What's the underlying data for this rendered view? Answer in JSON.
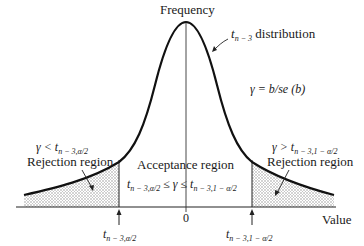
{
  "diagram": {
    "type": "t-distribution hypothesis test regions",
    "y_axis_label": "Frequency",
    "x_axis_label": "Value",
    "center_tick_label": "0",
    "curve_label": {
      "prefix": "t",
      "subscript": "n − 3",
      "suffix": " distribution"
    },
    "statistic": "γ = b/se (b)",
    "left_region": {
      "condition_prefix": "γ < t",
      "condition_subscript": "n − 3,α/2",
      "label": "Rejection region"
    },
    "right_region": {
      "condition_prefix": "γ > t",
      "condition_subscript": "n − 3,1 − α/2",
      "label": "Rejection region"
    },
    "acceptance_region": {
      "label": "Acceptance region",
      "lower_t": "t",
      "lower_sub": "n − 3,α/2",
      "middle": " ≤ γ ≤ ",
      "upper_t": "t",
      "upper_sub": "n − 3,1 − α/2"
    },
    "left_critical": {
      "t": "t",
      "sub": "n − 3,α/2"
    },
    "right_critical": {
      "t": "t",
      "sub": "n − 3,1 − α/2"
    },
    "colors": {
      "curve": "#111111",
      "axis": "#222222",
      "shading": "#9a9a9a"
    }
  }
}
